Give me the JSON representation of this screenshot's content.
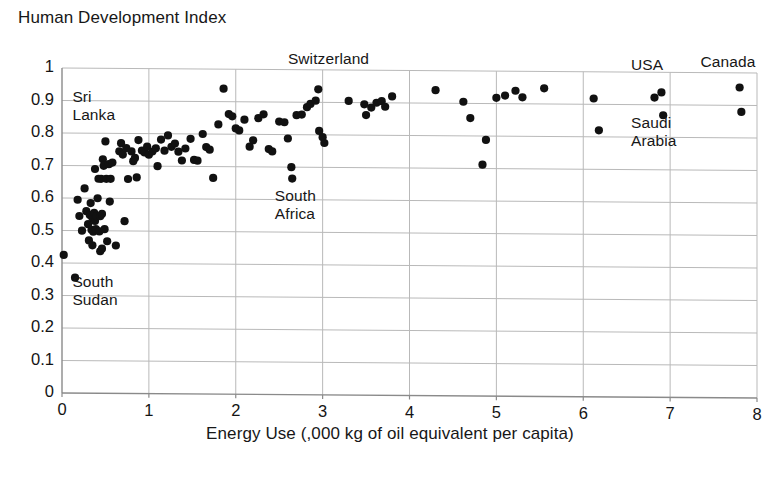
{
  "chart_data": {
    "type": "scatter",
    "title": "Human Development Index",
    "xlabel": "Energy Use (,000 kg of oil equivalent per capita)",
    "ylabel": "Human Development Index",
    "xlim": [
      0,
      8
    ],
    "ylim": [
      0,
      1
    ],
    "xticks": [
      "0",
      "1",
      "2",
      "3",
      "4",
      "5",
      "6",
      "7",
      "8"
    ],
    "yticks": [
      "0",
      "0.1",
      "0.2",
      "0.3",
      "0.4",
      "0.5",
      "0.6",
      "0.7",
      "0.8",
      "0.9",
      "1"
    ],
    "grid": true,
    "legend": "none",
    "marker_color": "#111111",
    "grid_color": "#b9b9b9",
    "axis_color": "#8a8a8a",
    "annotations": [
      {
        "text": "Switzerland",
        "x": 2.6,
        "y": 1.02,
        "note": "label above point near x=2.95, y=0.94"
      },
      {
        "text": "Sri\nLanka",
        "x": 0.12,
        "y": 0.9,
        "note": "two-line label"
      },
      {
        "text": "South\nAfrica",
        "x": 2.45,
        "y": 0.6,
        "note": "two-line label"
      },
      {
        "text": "South\nSudan",
        "x": 0.12,
        "y": 0.33,
        "note": "two-line label"
      },
      {
        "text": "USA",
        "x": 6.55,
        "y": 1.01
      },
      {
        "text": "Canada",
        "x": 7.35,
        "y": 1.02
      },
      {
        "text": "Saudi\nArabia",
        "x": 6.55,
        "y": 0.83,
        "note": "two-line label"
      }
    ],
    "points": [
      [
        0.02,
        0.425
      ],
      [
        0.15,
        0.355
      ],
      [
        0.18,
        0.595
      ],
      [
        0.2,
        0.545
      ],
      [
        0.23,
        0.5
      ],
      [
        0.26,
        0.63
      ],
      [
        0.28,
        0.56
      ],
      [
        0.3,
        0.52
      ],
      [
        0.31,
        0.47
      ],
      [
        0.32,
        0.548
      ],
      [
        0.33,
        0.585
      ],
      [
        0.34,
        0.503
      ],
      [
        0.35,
        0.54
      ],
      [
        0.35,
        0.455
      ],
      [
        0.36,
        0.497
      ],
      [
        0.37,
        0.555
      ],
      [
        0.38,
        0.53
      ],
      [
        0.38,
        0.69
      ],
      [
        0.39,
        0.505
      ],
      [
        0.4,
        0.545
      ],
      [
        0.41,
        0.6
      ],
      [
        0.42,
        0.66
      ],
      [
        0.43,
        0.498
      ],
      [
        0.44,
        0.545
      ],
      [
        0.44,
        0.437
      ],
      [
        0.45,
        0.66
      ],
      [
        0.46,
        0.552
      ],
      [
        0.46,
        0.445
      ],
      [
        0.47,
        0.72
      ],
      [
        0.48,
        0.7
      ],
      [
        0.49,
        0.505
      ],
      [
        0.5,
        0.775
      ],
      [
        0.51,
        0.66
      ],
      [
        0.52,
        0.468
      ],
      [
        0.54,
        0.705
      ],
      [
        0.55,
        0.59
      ],
      [
        0.56,
        0.66
      ],
      [
        0.58,
        0.71
      ],
      [
        0.62,
        0.455
      ],
      [
        0.66,
        0.745
      ],
      [
        0.68,
        0.77
      ],
      [
        0.7,
        0.735
      ],
      [
        0.72,
        0.53
      ],
      [
        0.74,
        0.755
      ],
      [
        0.76,
        0.66
      ],
      [
        0.8,
        0.745
      ],
      [
        0.82,
        0.715
      ],
      [
        0.84,
        0.725
      ],
      [
        0.86,
        0.665
      ],
      [
        0.88,
        0.78
      ],
      [
        0.92,
        0.748
      ],
      [
        0.95,
        0.742
      ],
      [
        0.98,
        0.76
      ],
      [
        1.0,
        0.735
      ],
      [
        1.04,
        0.745
      ],
      [
        1.08,
        0.755
      ],
      [
        1.1,
        0.7
      ],
      [
        1.14,
        0.782
      ],
      [
        1.18,
        0.748
      ],
      [
        1.22,
        0.795
      ],
      [
        1.26,
        0.76
      ],
      [
        1.3,
        0.77
      ],
      [
        1.34,
        0.745
      ],
      [
        1.38,
        0.718
      ],
      [
        1.42,
        0.755
      ],
      [
        1.48,
        0.785
      ],
      [
        1.52,
        0.72
      ],
      [
        1.56,
        0.718
      ],
      [
        1.62,
        0.8
      ],
      [
        1.66,
        0.76
      ],
      [
        1.7,
        0.752
      ],
      [
        1.74,
        0.665
      ],
      [
        1.8,
        0.83
      ],
      [
        1.86,
        0.94
      ],
      [
        1.92,
        0.862
      ],
      [
        1.96,
        0.855
      ],
      [
        2.0,
        0.818
      ],
      [
        2.04,
        0.812
      ],
      [
        2.1,
        0.845
      ],
      [
        2.16,
        0.762
      ],
      [
        2.2,
        0.782
      ],
      [
        2.26,
        0.85
      ],
      [
        2.32,
        0.862
      ],
      [
        2.38,
        0.755
      ],
      [
        2.42,
        0.748
      ],
      [
        2.5,
        0.84
      ],
      [
        2.56,
        0.838
      ],
      [
        2.6,
        0.788
      ],
      [
        2.64,
        0.7
      ],
      [
        2.65,
        0.665
      ],
      [
        2.7,
        0.86
      ],
      [
        2.76,
        0.862
      ],
      [
        2.82,
        0.885
      ],
      [
        2.86,
        0.895
      ],
      [
        2.92,
        0.905
      ],
      [
        2.95,
        0.94
      ],
      [
        2.96,
        0.812
      ],
      [
        3.0,
        0.793
      ],
      [
        3.02,
        0.775
      ],
      [
        3.3,
        0.905
      ],
      [
        3.48,
        0.895
      ],
      [
        3.5,
        0.862
      ],
      [
        3.56,
        0.885
      ],
      [
        3.62,
        0.9
      ],
      [
        3.68,
        0.905
      ],
      [
        3.72,
        0.888
      ],
      [
        3.8,
        0.92
      ],
      [
        4.3,
        0.94
      ],
      [
        4.62,
        0.905
      ],
      [
        4.7,
        0.855
      ],
      [
        4.84,
        0.712
      ],
      [
        4.88,
        0.788
      ],
      [
        5.0,
        0.918
      ],
      [
        5.1,
        0.925
      ],
      [
        5.22,
        0.94
      ],
      [
        5.3,
        0.92
      ],
      [
        5.55,
        0.948
      ],
      [
        6.12,
        0.918
      ],
      [
        6.18,
        0.82
      ],
      [
        6.82,
        0.922
      ],
      [
        6.9,
        0.938
      ],
      [
        6.92,
        0.868
      ],
      [
        7.8,
        0.955
      ],
      [
        7.82,
        0.88
      ]
    ]
  }
}
